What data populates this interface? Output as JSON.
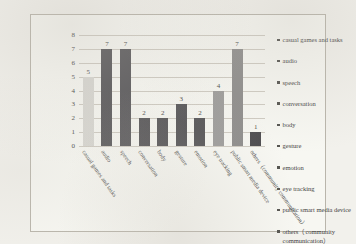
{
  "chart_data": {
    "type": "bar",
    "title": "",
    "xlabel": "",
    "ylabel": "",
    "ylim": [
      0,
      8
    ],
    "yticks": [
      0,
      1,
      2,
      3,
      4,
      5,
      6,
      7,
      8
    ],
    "grid": true,
    "legend_position": "right",
    "categories": [
      "casual games and tasks",
      "audio",
      "speech",
      "conversation",
      "body",
      "gesture",
      "emotion",
      "eye tracking",
      "public smart media device",
      "others（community communication）"
    ],
    "values": [
      5,
      7,
      7,
      2,
      2,
      3,
      2,
      4,
      7,
      1
    ],
    "bar_colors": [
      "#d8d7d2",
      "#58575a",
      "#5a595c",
      "#555457",
      "#555457",
      "#555457",
      "#555457",
      "#9d9c9b",
      "#8e8d8c",
      "#4c4b4e"
    ],
    "data_labels": [
      "5",
      "7",
      "7",
      "2",
      "2",
      "3",
      "2",
      "4",
      "7",
      "1"
    ]
  },
  "legend": {
    "items": [
      "casual games and tasks",
      "audio",
      "speech",
      "conversation",
      "body",
      "gesture",
      "emotion",
      "eye tracking",
      "public smart media device",
      "others（community communication）"
    ]
  }
}
